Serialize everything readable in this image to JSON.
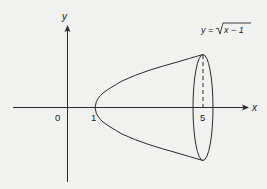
{
  "figure": {
    "axes": {
      "x_label": "x",
      "y_label": "y",
      "origin_label": "0"
    },
    "ticks": {
      "x_start": "1",
      "x_end": "5"
    },
    "curve_label": {
      "lhs": "y =",
      "radicand": "x − 1"
    },
    "colors": {
      "background": "#f1f1f0",
      "ink": "#2a2a2a"
    }
  }
}
